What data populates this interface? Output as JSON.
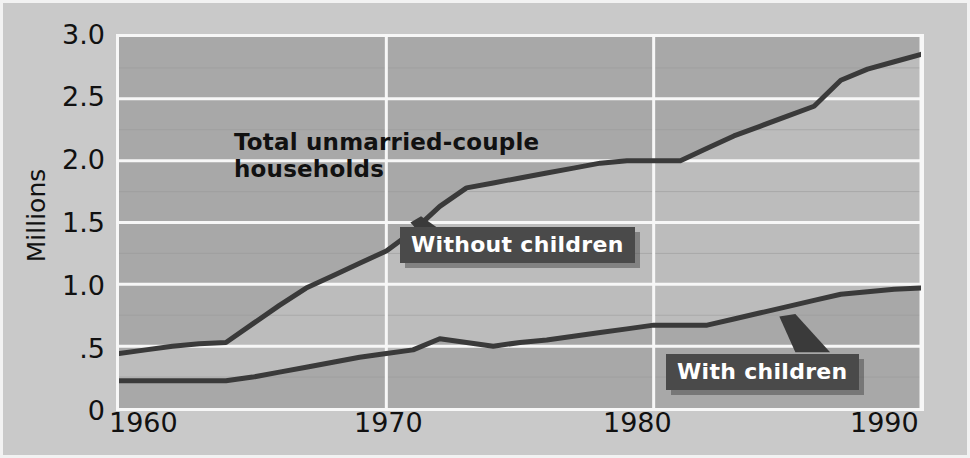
{
  "chart_data": {
    "type": "line",
    "title": "",
    "xlabel": "",
    "ylabel": "Millions",
    "xlim": [
      1960,
      1990
    ],
    "ylim": [
      0,
      3.0
    ],
    "grid": true,
    "legend_position": "inline-annotations",
    "x_ticks": [
      "1960",
      "1970",
      "1980",
      "1990"
    ],
    "x_tick_values": [
      1960,
      1970,
      1980,
      1990
    ],
    "y_ticks": [
      "0",
      ".5",
      "1.0",
      "1.5",
      "2.0",
      "2.5",
      "3.0"
    ],
    "y_tick_values": [
      0,
      0.5,
      1.0,
      1.5,
      2.0,
      2.5,
      3.0
    ],
    "annotations": [
      {
        "text_line1": "Total unmarried-couple",
        "text_line2": "households",
        "style": "plain"
      },
      {
        "text": "Without children",
        "style": "callout"
      },
      {
        "text": "With children",
        "style": "callout"
      }
    ],
    "series": [
      {
        "name": "Without children",
        "x": [
          1960,
          1961,
          1962,
          1963,
          1964,
          1965,
          1966,
          1967,
          1968,
          1969,
          1970,
          1971,
          1972,
          1973,
          1974,
          1975,
          1976,
          1977,
          1978,
          1979,
          1980,
          1981,
          1982,
          1983,
          1984,
          1985,
          1986,
          1987,
          1988,
          1989,
          1990
        ],
        "values": [
          0.44,
          0.47,
          0.5,
          0.52,
          0.53,
          0.68,
          0.83,
          0.97,
          1.07,
          1.17,
          1.27,
          1.43,
          1.63,
          1.78,
          1.82,
          1.86,
          1.9,
          1.94,
          1.98,
          2.0,
          2.0,
          2.0,
          2.1,
          2.2,
          2.28,
          2.36,
          2.44,
          2.65,
          2.74,
          2.8,
          2.86
        ]
      },
      {
        "name": "With children",
        "x": [
          1960,
          1961,
          1962,
          1963,
          1964,
          1965,
          1966,
          1967,
          1968,
          1969,
          1970,
          1971,
          1972,
          1973,
          1974,
          1975,
          1976,
          1977,
          1978,
          1979,
          1980,
          1981,
          1982,
          1983,
          1984,
          1985,
          1986,
          1987,
          1988,
          1989,
          1990
        ],
        "values": [
          0.22,
          0.22,
          0.22,
          0.22,
          0.22,
          0.25,
          0.29,
          0.33,
          0.37,
          0.41,
          0.44,
          0.47,
          0.56,
          0.53,
          0.5,
          0.53,
          0.55,
          0.58,
          0.61,
          0.64,
          0.67,
          0.67,
          0.67,
          0.72,
          0.77,
          0.82,
          0.87,
          0.92,
          0.94,
          0.96,
          0.97
        ]
      }
    ],
    "colors": {
      "figure_background": "#c9c9c9",
      "plot_background": "#b4b4b4",
      "band_upper": "#a8a8a8",
      "band_lower": "#bcbcbc",
      "gridline_major": "#f7f7f7",
      "gridline_minor": "#9a9a9a",
      "line": "#3a3a3a",
      "callout_background": "#4a4a4a",
      "callout_text": "#ffffff",
      "axis_text": "#111111"
    }
  }
}
